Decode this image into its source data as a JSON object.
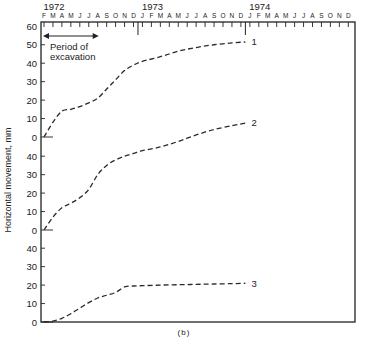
{
  "chart_data": {
    "type": "line",
    "caption": "(b)",
    "xlabel": "",
    "ylabel": "Horizontal movement, mm",
    "years": [
      {
        "label": "1972",
        "month_index": 0
      },
      {
        "label": "1973",
        "month_index": 11
      },
      {
        "label": "1974",
        "month_index": 23
      }
    ],
    "month_ticks": [
      "F",
      "M",
      "A",
      "M",
      "J",
      "J",
      "A",
      "S",
      "O",
      "N",
      "D",
      "J",
      "F",
      "M",
      "A",
      "M",
      "J",
      "J",
      "A",
      "S",
      "O",
      "N",
      "D",
      "J",
      "F",
      "M",
      "A",
      "M",
      "J",
      "J",
      "A",
      "S",
      "O",
      "N",
      "D"
    ],
    "annotation": {
      "text_line1": "Period of",
      "text_line2": "excavation",
      "start_month_index": 0,
      "end_month_index": 6
    },
    "y_axis_segments": [
      {
        "curve": "1",
        "ticks": [
          0,
          10,
          20,
          30,
          40,
          50,
          60
        ]
      },
      {
        "curve": "2",
        "ticks": [
          0,
          10,
          20,
          30,
          40
        ]
      },
      {
        "curve": "3",
        "ticks": [
          0,
          10,
          20,
          30,
          40
        ]
      }
    ],
    "ylim": [
      0,
      60
    ],
    "grid": false,
    "legend": "inline labels at curve ends",
    "series": [
      {
        "name": "1",
        "x_month_index": [
          0,
          1,
          2,
          3,
          4,
          5,
          6,
          7,
          8,
          9,
          10,
          11,
          13,
          15,
          17,
          19,
          21,
          22.5
        ],
        "values": [
          0,
          8,
          14,
          15,
          16.5,
          18.5,
          21,
          26,
          31,
          36,
          39,
          41,
          43.5,
          46.5,
          48.5,
          50,
          51,
          51.5
        ]
      },
      {
        "name": "2",
        "x_month_index": [
          0,
          1,
          2,
          3,
          4,
          5,
          6,
          7,
          8,
          9,
          10,
          11,
          13,
          15,
          17,
          19,
          21,
          22.5
        ],
        "values": [
          0,
          7,
          12,
          14.5,
          17.5,
          22,
          30,
          35,
          38,
          40,
          41.5,
          43,
          45,
          48,
          51.5,
          54.5,
          56.5,
          58
        ]
      },
      {
        "name": "3",
        "x_month_index": [
          0,
          1,
          2,
          3,
          4,
          5,
          6,
          7,
          8,
          9,
          10,
          11,
          13,
          15,
          17,
          19,
          21,
          22.5
        ],
        "values": [
          0,
          0.5,
          2,
          4.5,
          7.5,
          10.5,
          13,
          14.5,
          16,
          19,
          19.5,
          19.7,
          20,
          20.2,
          20.4,
          20.6,
          20.8,
          21
        ]
      }
    ]
  },
  "colors": {
    "axis": "#222222",
    "line": "#2a2a2a",
    "background": "#ffffff"
  }
}
